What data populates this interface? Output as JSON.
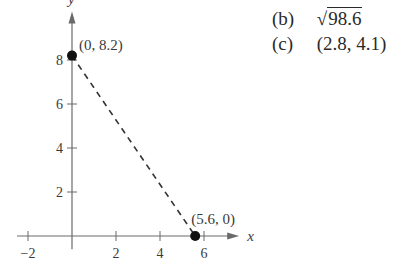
{
  "chart_data": {
    "type": "scatter",
    "title": "",
    "xlabel": "x",
    "ylabel": "y",
    "xlim": [
      -2.5,
      7.6
    ],
    "ylim": [
      -0.6,
      10.2
    ],
    "x_ticks": [
      -2,
      2,
      4,
      6
    ],
    "x_tick_labels": [
      "−2",
      "2",
      "4",
      "6"
    ],
    "y_ticks": [
      2,
      4,
      6,
      8
    ],
    "y_tick_labels": [
      "2",
      "4",
      "6",
      "8"
    ],
    "grid": false,
    "points": [
      {
        "x": 0,
        "y": 8.2,
        "label": "(0, 8.2)"
      },
      {
        "x": 5.6,
        "y": 0,
        "label": "(5.6, 0)"
      }
    ],
    "segments": [
      {
        "from": [
          0,
          8.2
        ],
        "to": [
          5.6,
          0
        ],
        "style": "dashed"
      }
    ]
  },
  "answers": [
    {
      "label": "(b)",
      "sqrt": true,
      "value": "98.6"
    },
    {
      "label": "(c)",
      "sqrt": false,
      "value": "(2.8, 4.1)"
    }
  ]
}
